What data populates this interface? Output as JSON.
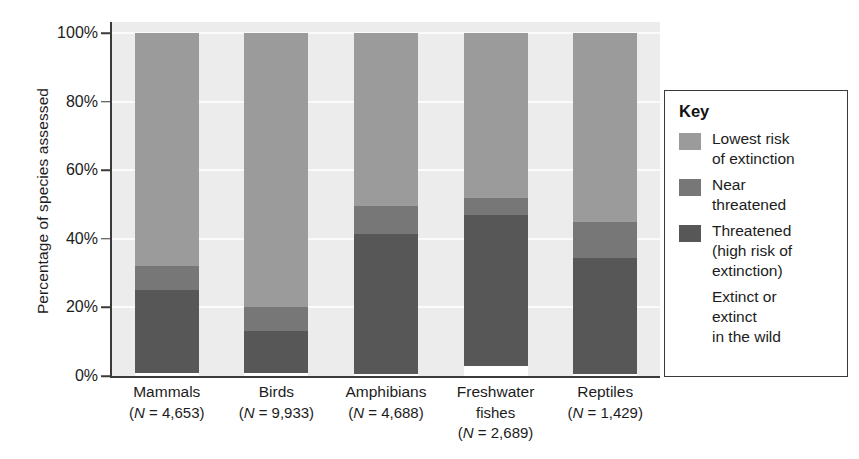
{
  "chart_data": {
    "type": "bar",
    "subtype": "stacked-bar-100-percent",
    "title": "",
    "xlabel": "",
    "ylabel": "Percentage of species assessed",
    "ylim": [
      0,
      100
    ],
    "ytick_labels": [
      "0%",
      "20%",
      "40%",
      "60%",
      "80%",
      "100%"
    ],
    "ytick_values": [
      0,
      20,
      40,
      60,
      80,
      100
    ],
    "grid": true,
    "grid_axis": "y",
    "legend_position": "right",
    "categories": [
      "Mammals",
      "Birds",
      "Amphibians",
      "Freshwater fishes",
      "Reptiles"
    ],
    "category_lines": [
      [
        "Mammals",
        "(N = 4,653)"
      ],
      [
        "Birds",
        "(N = 9,933)"
      ],
      [
        "Amphibians",
        "(N = 4,688)"
      ],
      [
        "Freshwater",
        "fishes",
        "(N = 2,689)"
      ],
      [
        "Reptiles",
        "(N = 1,429)"
      ]
    ],
    "sample_sizes": [
      4653,
      9933,
      4688,
      2689,
      1429
    ],
    "series": [
      {
        "name": "Extinct or extinct in the wild",
        "color": "#ffffff",
        "values": [
          1,
          1,
          0.5,
          3,
          0.5
        ]
      },
      {
        "name": "Threatened (high risk of extinction)",
        "color": "#575757",
        "values": [
          24,
          12,
          41,
          44,
          34
        ]
      },
      {
        "name": "Near threatened",
        "color": "#777777",
        "values": [
          7,
          7,
          8,
          5,
          10.5
        ]
      },
      {
        "name": "Lowest risk of extinction",
        "color": "#9b9b9b",
        "values": [
          68,
          80,
          50.5,
          48,
          55
        ]
      }
    ],
    "cumulative_tops": {
      "Mammals": {
        "extinct": 1,
        "threatened": 25,
        "near_threatened": 32,
        "lowest_risk": 100
      },
      "Birds": {
        "extinct": 1,
        "threatened": 13,
        "near_threatened": 20,
        "lowest_risk": 100
      },
      "Amphibians": {
        "extinct": 0.5,
        "threatened": 41.5,
        "near_threatened": 49.5,
        "lowest_risk": 100
      },
      "Freshwater fishes": {
        "extinct": 3,
        "threatened": 47,
        "near_threatened": 52,
        "lowest_risk": 100
      },
      "Reptiles": {
        "extinct": 0.5,
        "threatened": 34.5,
        "near_threatened": 45,
        "lowest_risk": 100
      }
    }
  },
  "axes": {
    "y_title": "Percentage of species assessed",
    "y_ticks": [
      {
        "label": "100%",
        "value": 100
      },
      {
        "label": "80%",
        "value": 80
      },
      {
        "label": "60%",
        "value": 60
      },
      {
        "label": "40%",
        "value": 40
      },
      {
        "label": "20%",
        "value": 20
      },
      {
        "label": "0%",
        "value": 0
      }
    ]
  },
  "categories": [
    {
      "name": "Mammals",
      "n_line": "(N = 4,653)",
      "extra_line": ""
    },
    {
      "name": "Birds",
      "n_line": "(N = 9,933)",
      "extra_line": ""
    },
    {
      "name": "Amphibians",
      "n_line": "(N = 4,688)",
      "extra_line": ""
    },
    {
      "name": "Freshwater",
      "n_line": "fishes",
      "extra_line": "(N = 2,689)"
    },
    {
      "name": "Reptiles",
      "n_line": "(N = 1,429)",
      "extra_line": ""
    }
  ],
  "legend": {
    "title": "Key",
    "items": [
      {
        "lines": [
          "Lowest risk",
          "of extinction"
        ],
        "color": "#9b9b9b",
        "swatch_visible": true
      },
      {
        "lines": [
          "Near",
          "threatened"
        ],
        "color": "#777777",
        "swatch_visible": true
      },
      {
        "lines": [
          "Threatened",
          "(high risk of",
          "extinction)"
        ],
        "color": "#575757",
        "swatch_visible": true
      },
      {
        "lines": [
          "Extinct or",
          "extinct",
          "in the wild"
        ],
        "color": "#ffffff",
        "swatch_visible": false
      }
    ]
  },
  "colors": {
    "lowest_risk": "#9b9b9b",
    "near_threatened": "#777777",
    "threatened": "#575757",
    "extinct": "#ffffff",
    "plot_background": "#ececec",
    "gridline": "#fbfbfb",
    "axis": "#3a3a3a",
    "text": "#1c1c1c"
  }
}
